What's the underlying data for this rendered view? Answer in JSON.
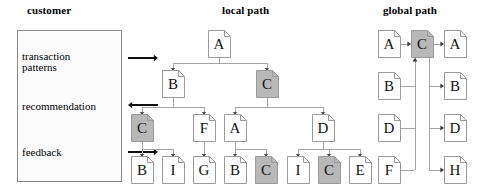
{
  "columns": {
    "customer": {
      "title": "customer",
      "title_x": 27,
      "title_y": 4
    },
    "local": {
      "title": "local path",
      "title_x": 222,
      "title_y": 4
    },
    "global": {
      "title": "global path",
      "title_x": 383,
      "title_y": 4
    }
  },
  "customer_panel": {
    "box": {
      "x": 17,
      "y": 30,
      "width": 105,
      "height": 152
    },
    "labels": [
      {
        "id": "transaction-patterns",
        "text": "transaction",
        "x": 22,
        "y": 50
      },
      {
        "id": "transaction-patterns-2",
        "text": "patterns",
        "x": 22,
        "y": 61
      },
      {
        "id": "recommendation",
        "text": "recommendation",
        "x": 22,
        "y": 100
      },
      {
        "id": "feedback",
        "text": "feedback",
        "x": 22,
        "y": 146
      }
    ],
    "arrows": [
      {
        "id": "arrow-transaction-patterns",
        "direction": "right",
        "x1": 128,
        "y": 58,
        "x2": 158
      },
      {
        "id": "arrow-recommendation",
        "direction": "left",
        "x1": 128,
        "y": 105,
        "x2": 158
      },
      {
        "id": "arrow-feedback",
        "direction": "right",
        "x1": 128,
        "y": 152,
        "x2": 158
      }
    ]
  },
  "local_path": {
    "nodes": [
      {
        "id": "local-a-root",
        "label": "A",
        "x": 208,
        "y": 30,
        "highlight": false
      },
      {
        "id": "local-b-1",
        "label": "B",
        "x": 162,
        "y": 70,
        "highlight": false
      },
      {
        "id": "local-c-1",
        "label": "C",
        "x": 256,
        "y": 70,
        "highlight": true
      },
      {
        "id": "local-c-2",
        "label": "C",
        "x": 131,
        "y": 114,
        "highlight": true
      },
      {
        "id": "local-f-1",
        "label": "F",
        "x": 193,
        "y": 114,
        "highlight": false
      },
      {
        "id": "local-a-2",
        "label": "A",
        "x": 224,
        "y": 114,
        "highlight": false
      },
      {
        "id": "local-d-1",
        "label": "D",
        "x": 312,
        "y": 114,
        "highlight": false
      },
      {
        "id": "local-b-2",
        "label": "B",
        "x": 131,
        "y": 156,
        "highlight": false
      },
      {
        "id": "local-i-1",
        "label": "I",
        "x": 162,
        "y": 156,
        "highlight": false
      },
      {
        "id": "local-g-1",
        "label": "G",
        "x": 193,
        "y": 156,
        "highlight": false
      },
      {
        "id": "local-b-3",
        "label": "B",
        "x": 224,
        "y": 156,
        "highlight": false
      },
      {
        "id": "local-c-3",
        "label": "C",
        "x": 255,
        "y": 156,
        "highlight": true
      },
      {
        "id": "local-i-2",
        "label": "I",
        "x": 287,
        "y": 156,
        "highlight": false
      },
      {
        "id": "local-c-4",
        "label": "C",
        "x": 318,
        "y": 156,
        "highlight": true
      },
      {
        "id": "local-e-1",
        "label": "E",
        "x": 349,
        "y": 156,
        "highlight": false
      }
    ]
  },
  "global_path": {
    "nodes": [
      {
        "id": "global-a-left",
        "label": "A",
        "x": 378,
        "y": 30,
        "highlight": false
      },
      {
        "id": "global-c-center",
        "label": "C",
        "x": 411,
        "y": 30,
        "highlight": true
      },
      {
        "id": "global-a-right",
        "label": "A",
        "x": 444,
        "y": 30,
        "highlight": false
      },
      {
        "id": "global-b-left",
        "label": "B",
        "x": 378,
        "y": 72,
        "highlight": false
      },
      {
        "id": "global-b-right",
        "label": "B",
        "x": 444,
        "y": 72,
        "highlight": false
      },
      {
        "id": "global-d-left",
        "label": "D",
        "x": 378,
        "y": 114,
        "highlight": false
      },
      {
        "id": "global-d-right",
        "label": "D",
        "x": 444,
        "y": 114,
        "highlight": false
      },
      {
        "id": "global-f-left",
        "label": "F",
        "x": 378,
        "y": 156,
        "highlight": false
      },
      {
        "id": "global-h-right",
        "label": "H",
        "x": 444,
        "y": 156,
        "highlight": false
      }
    ]
  },
  "colors": {
    "node_fill": "#ffffff",
    "node_highlight_fill": "#b8b8b8",
    "node_stroke": "#9a9a9a",
    "edge": "#a5a5a5",
    "arrow": "#111111",
    "box_stroke": "#8a8a8a"
  }
}
